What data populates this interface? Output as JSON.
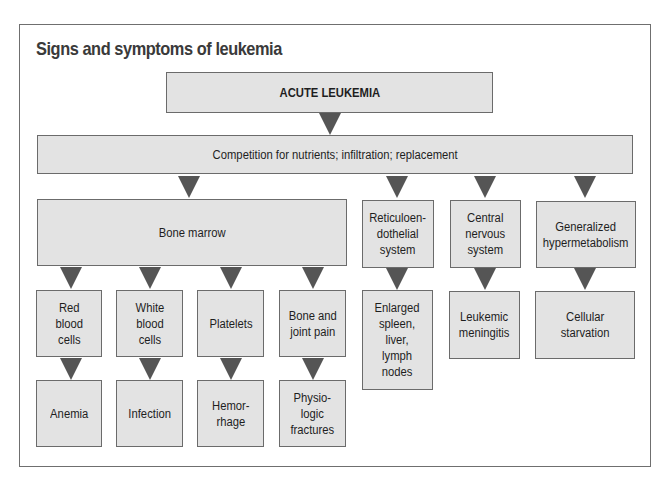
{
  "title": "Signs and symptoms of leukemia",
  "colors": {
    "box_fill": "#e3e3e3",
    "box_border": "#6b6b6b",
    "arrow": "#555555",
    "frame_border": "#6f6f6f"
  },
  "nodes": {
    "root": "ACUTE LEUKEMIA",
    "mechanism": "Competition for nutrients; infiltration; replacement",
    "bone_marrow": "Bone marrow",
    "reticuloendothelial": "Reticuloen-\ndothelial\nsystem",
    "cns": "Central\nnervous\nsystem",
    "hypermetabolism": "Generalized\nhypermetabolism",
    "red_cells": "Red\nblood\ncells",
    "white_cells": "White\nblood\ncells",
    "platelets": "Platelets",
    "bone_joint": "Bone and\njoint pain",
    "enlarged": "Enlarged\nspleen,\nliver,\nlymph\nnodes",
    "meningitis": "Leukemic\nmeningitis",
    "starvation": "Cellular\nstarvation",
    "anemia": "Anemia",
    "infection": "Infection",
    "hemorrhage": "Hemor-\nrhage",
    "fractures": "Physio-\nlogic\nfractures"
  },
  "edges": [
    [
      "root",
      "mechanism"
    ],
    [
      "mechanism",
      "bone_marrow"
    ],
    [
      "mechanism",
      "reticuloendothelial"
    ],
    [
      "mechanism",
      "cns"
    ],
    [
      "mechanism",
      "hypermetabolism"
    ],
    [
      "bone_marrow",
      "red_cells"
    ],
    [
      "bone_marrow",
      "white_cells"
    ],
    [
      "bone_marrow",
      "platelets"
    ],
    [
      "bone_marrow",
      "bone_joint"
    ],
    [
      "reticuloendothelial",
      "enlarged"
    ],
    [
      "cns",
      "meningitis"
    ],
    [
      "hypermetabolism",
      "starvation"
    ],
    [
      "red_cells",
      "anemia"
    ],
    [
      "white_cells",
      "infection"
    ],
    [
      "platelets",
      "hemorrhage"
    ],
    [
      "bone_joint",
      "fractures"
    ]
  ]
}
